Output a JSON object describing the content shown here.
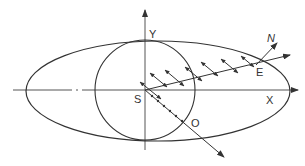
{
  "diagram": {
    "title": "",
    "labels": {
      "y_axis": "Y",
      "x_axis": "X",
      "origin": "S",
      "normal": "N",
      "point_e": "E",
      "point_o": "O"
    },
    "shapes": {
      "ellipse": {
        "cx": 158,
        "cy": 91,
        "rx": 132,
        "ry": 50
      },
      "circle": {
        "cx": 145,
        "cy": 90,
        "r": 50
      }
    },
    "colors": {
      "stroke": "#333333",
      "background": "#ffffff"
    }
  }
}
